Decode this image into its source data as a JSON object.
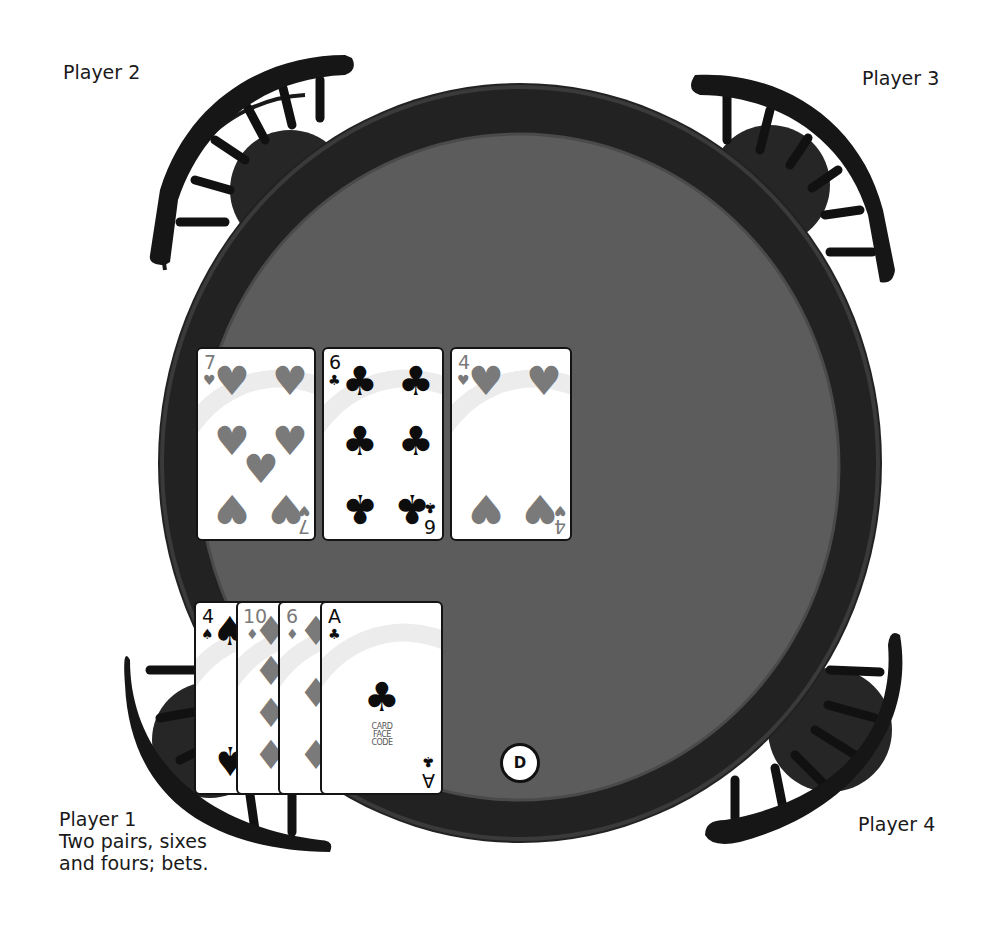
{
  "players": {
    "player1": {
      "name": "Player 1",
      "status_line1": "Two pairs, sixes",
      "status_line2": "and fours; bets."
    },
    "player2": {
      "name": "Player 2"
    },
    "player3": {
      "name": "Player 3"
    },
    "player4": {
      "name": "Player 4"
    }
  },
  "dealer_button": {
    "label": "D"
  },
  "community_cards": [
    {
      "rank": "7",
      "suit": "♥",
      "suit_name": "hearts"
    },
    {
      "rank": "6",
      "suit": "♣",
      "suit_name": "clubs"
    },
    {
      "rank": "4",
      "suit": "♥",
      "suit_name": "hearts"
    }
  ],
  "player1_hand": [
    {
      "rank": "4",
      "suit": "♠",
      "suit_name": "spades"
    },
    {
      "rank": "10",
      "suit": "♦",
      "suit_name": "diamonds"
    },
    {
      "rank": "6",
      "suit": "♦",
      "suit_name": "diamonds"
    },
    {
      "rank": "A",
      "suit": "♣",
      "suit_name": "clubs"
    }
  ],
  "card_logo": "CARD\nFACE\nCODE",
  "colors": {
    "background": "#ffffff",
    "table_rim": "#262626",
    "table_felt": "#5b5b5b",
    "chair": "#141414",
    "red_suit": "#7a7a7a",
    "black_suit": "#0d0d0d"
  }
}
